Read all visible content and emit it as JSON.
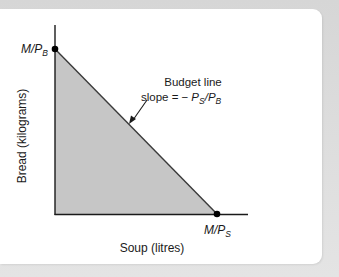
{
  "diagram": {
    "y_axis_label": "Bread (kilograms)",
    "x_axis_label": "Soup (litres)",
    "y_intercept_label": {
      "main": "M/P",
      "sub": "B"
    },
    "x_intercept_label": {
      "main": "M/P",
      "sub": "S"
    },
    "annotation": {
      "line1": "Budget line",
      "line2_prefix": "slope = −",
      "line2_p1": "P",
      "line2_p1_sub": "S",
      "line2_slash": "/",
      "line2_p2": "P",
      "line2_p2_sub": "B"
    },
    "colors": {
      "fill": "#c6c6c6",
      "line": "#2b2b2b",
      "axis": "#1a1a1a",
      "frame": "#dcdcdc",
      "panel": "#ffffff"
    }
  }
}
